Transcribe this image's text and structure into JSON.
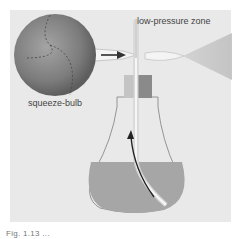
{
  "diagram": {
    "labels": {
      "low_pressure": "low-pressure zone",
      "bulb": "squeeze-bulb"
    },
    "caption": "Fig. 1.13 ...",
    "colors": {
      "background": "#e9e9e9",
      "bulb": "#7a7a7a",
      "liquid": "#a6a6a6",
      "bottle_outline": "#8a8a8a",
      "arrow": "#333333"
    }
  }
}
